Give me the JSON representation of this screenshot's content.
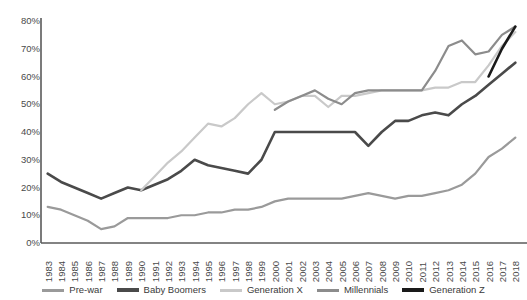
{
  "chart_data": {
    "type": "line",
    "title": "",
    "xlabel": "",
    "ylabel": "",
    "ylim": [
      0,
      80
    ],
    "grid": false,
    "legend_position": "bottom",
    "y_ticks": [
      "0%",
      "10%",
      "20%",
      "30%",
      "40%",
      "50%",
      "60%",
      "70%",
      "80%"
    ],
    "y_tick_values": [
      0,
      10,
      20,
      30,
      40,
      50,
      60,
      70,
      80
    ],
    "categories": [
      "1983",
      "1984",
      "1985",
      "1986",
      "1987",
      "1988",
      "1989",
      "1990",
      "1991",
      "1992",
      "1993",
      "1994",
      "1995",
      "1996",
      "1997",
      "1998",
      "1999",
      "2000",
      "2001",
      "2002",
      "2003",
      "2004",
      "2005",
      "2006",
      "2007",
      "2008",
      "2009",
      "2010",
      "2011",
      "2012",
      "2013",
      "2014",
      "2015",
      "2016",
      "2017",
      "2018"
    ],
    "series": [
      {
        "name": "Pre-war",
        "color": "#9a9a9a",
        "x": [
          "1983",
          "1984",
          "1985",
          "1986",
          "1987",
          "1988",
          "1989",
          "1990",
          "1991",
          "1992",
          "1993",
          "1994",
          "1995",
          "1996",
          "1997",
          "1998",
          "1999",
          "2000",
          "2001",
          "2002",
          "2003",
          "2004",
          "2005",
          "2006",
          "2007",
          "2008",
          "2009",
          "2010",
          "2011",
          "2012",
          "2013",
          "2014",
          "2015",
          "2016",
          "2017",
          "2018"
        ],
        "values": [
          13,
          12,
          10,
          8,
          5,
          6,
          9,
          9,
          9,
          9,
          10,
          10,
          11,
          11,
          12,
          12,
          13,
          15,
          16,
          16,
          16,
          16,
          16,
          17,
          18,
          17,
          16,
          17,
          17,
          18,
          19,
          21,
          25,
          31,
          34,
          38
        ]
      },
      {
        "name": "Baby Boomers",
        "color": "#4a4a4a",
        "x": [
          "1983",
          "1984",
          "1985",
          "1986",
          "1987",
          "1988",
          "1989",
          "1990",
          "1991",
          "1992",
          "1993",
          "1994",
          "1995",
          "1996",
          "1997",
          "1998",
          "1999",
          "2000",
          "2001",
          "2002",
          "2003",
          "2004",
          "2005",
          "2006",
          "2007",
          "2008",
          "2009",
          "2010",
          "2011",
          "2012",
          "2013",
          "2014",
          "2015",
          "2016",
          "2017",
          "2018"
        ],
        "values": [
          25,
          22,
          20,
          18,
          16,
          18,
          20,
          19,
          21,
          23,
          26,
          30,
          28,
          27,
          26,
          25,
          30,
          40,
          40,
          40,
          40,
          40,
          40,
          40,
          35,
          40,
          44,
          44,
          46,
          47,
          46,
          50,
          53,
          57,
          61,
          65
        ]
      },
      {
        "name": "Generation X",
        "color": "#c9c9c9",
        "x": [
          "1990",
          "1991",
          "1992",
          "1993",
          "1994",
          "1995",
          "1996",
          "1997",
          "1998",
          "1999",
          "2000",
          "2001",
          "2002",
          "2003",
          "2004",
          "2005",
          "2006",
          "2007",
          "2008",
          "2009",
          "2010",
          "2011",
          "2012",
          "2013",
          "2014",
          "2015",
          "2016",
          "2017",
          "2018"
        ],
        "values": [
          19,
          24,
          29,
          33,
          38,
          43,
          42,
          45,
          50,
          54,
          50,
          51,
          53,
          53,
          49,
          53,
          53,
          54,
          55,
          55,
          55,
          55,
          56,
          56,
          58,
          58,
          64,
          71,
          76
        ]
      },
      {
        "name": "Millennials",
        "color": "#8c8c8c",
        "x": [
          "2000",
          "2001",
          "2002",
          "2003",
          "2004",
          "2005",
          "2006",
          "2007",
          "2008",
          "2009",
          "2010",
          "2011",
          "2012",
          "2013",
          "2014",
          "2015",
          "2016",
          "2017",
          "2018"
        ],
        "values": [
          48,
          51,
          53,
          55,
          52,
          50,
          54,
          55,
          55,
          55,
          55,
          55,
          62,
          71,
          73,
          68,
          69,
          75,
          78
        ]
      },
      {
        "name": "Generation Z",
        "color": "#1a1a1a",
        "x": [
          "2016",
          "2017",
          "2018"
        ],
        "values": [
          60,
          70,
          78
        ]
      }
    ]
  },
  "legend": {
    "items": [
      {
        "label": "Pre-war",
        "color": "#9a9a9a",
        "thickness": 3
      },
      {
        "label": "Baby Boomers",
        "color": "#4a4a4a",
        "thickness": 4
      },
      {
        "label": "Generation X",
        "color": "#c9c9c9",
        "thickness": 3
      },
      {
        "label": "Millennials",
        "color": "#8c8c8c",
        "thickness": 3
      },
      {
        "label": "Generation Z",
        "color": "#1a1a1a",
        "thickness": 4
      }
    ]
  },
  "axes": {
    "axis_color": "#5a5a5a"
  }
}
